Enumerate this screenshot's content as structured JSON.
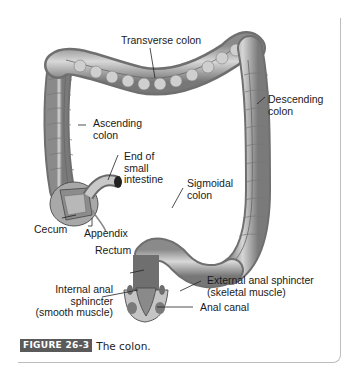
{
  "figure": {
    "tag": "FIGURE 26-3",
    "caption": "The colon.",
    "tag_color": "#5a5a5a"
  },
  "labels": {
    "transverse_colon": "Transverse colon",
    "descending_colon": "Descending\ncolon",
    "ascending_colon": "Ascending\ncolon",
    "end_small_intestine": "End of\nsmall\nintestine",
    "sigmoidal_colon": "Sigmoidal\ncolon",
    "cecum": "Cecum",
    "appendix": "Appendix",
    "rectum": "Rectum",
    "internal_anal_sphincter": "Internal anal\nsphincter\n(smooth muscle)",
    "external_anal_sphincter": "External anal sphincter\n(skeletal muscle)",
    "anal_canal": "Anal canal"
  }
}
